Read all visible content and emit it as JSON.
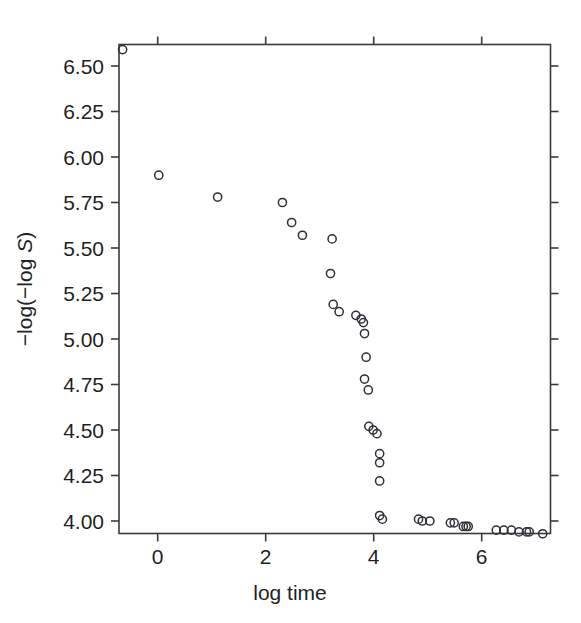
{
  "chart_data": {
    "type": "scatter",
    "title": "",
    "subtitle": "",
    "xlabel": "log time",
    "ylabel": "-log(-log S)",
    "ylabel_parts": {
      "prefix": "−log(−log ",
      "italic": "S",
      "suffix": ")"
    },
    "xlim": [
      -0.72,
      7.28
    ],
    "ylim": [
      3.9,
      6.6
    ],
    "xticks": [
      0,
      2,
      4,
      6
    ],
    "xtick_labels": [
      "0",
      "2",
      "4",
      "6"
    ],
    "yticks": [
      4.0,
      4.25,
      4.5,
      4.75,
      5.0,
      5.25,
      5.5,
      5.75,
      6.0,
      6.25,
      6.5
    ],
    "ytick_labels": [
      "4.00",
      "4.25",
      "4.50",
      "4.75",
      "5.00",
      "5.25",
      "5.50",
      "5.75",
      "6.00",
      "6.25",
      "6.50"
    ],
    "grid": false,
    "legend": null,
    "marker": "open-circle",
    "marker_color": "#2e2e38",
    "points": [
      {
        "x": -0.65,
        "y": 6.59
      },
      {
        "x": 0.02,
        "y": 5.9
      },
      {
        "x": 1.11,
        "y": 5.78
      },
      {
        "x": 2.31,
        "y": 5.75
      },
      {
        "x": 2.48,
        "y": 5.64
      },
      {
        "x": 2.68,
        "y": 5.57
      },
      {
        "x": 3.23,
        "y": 5.55
      },
      {
        "x": 3.2,
        "y": 5.36
      },
      {
        "x": 3.25,
        "y": 5.19
      },
      {
        "x": 3.36,
        "y": 5.15
      },
      {
        "x": 3.67,
        "y": 5.13
      },
      {
        "x": 3.77,
        "y": 5.11
      },
      {
        "x": 3.81,
        "y": 5.09
      },
      {
        "x": 3.83,
        "y": 5.03
      },
      {
        "x": 3.86,
        "y": 4.9
      },
      {
        "x": 3.83,
        "y": 4.78
      },
      {
        "x": 3.9,
        "y": 4.72
      },
      {
        "x": 3.91,
        "y": 4.52
      },
      {
        "x": 3.99,
        "y": 4.5
      },
      {
        "x": 4.06,
        "y": 4.48
      },
      {
        "x": 4.11,
        "y": 4.37
      },
      {
        "x": 4.11,
        "y": 4.32
      },
      {
        "x": 4.11,
        "y": 4.22
      },
      {
        "x": 4.11,
        "y": 4.03
      },
      {
        "x": 4.16,
        "y": 4.01
      },
      {
        "x": 4.83,
        "y": 4.01
      },
      {
        "x": 4.9,
        "y": 4.0
      },
      {
        "x": 5.04,
        "y": 4.0
      },
      {
        "x": 5.42,
        "y": 3.99
      },
      {
        "x": 5.49,
        "y": 3.99
      },
      {
        "x": 5.66,
        "y": 3.97
      },
      {
        "x": 5.71,
        "y": 3.97
      },
      {
        "x": 5.75,
        "y": 3.97
      },
      {
        "x": 6.27,
        "y": 3.95
      },
      {
        "x": 6.41,
        "y": 3.95
      },
      {
        "x": 6.55,
        "y": 3.95
      },
      {
        "x": 6.69,
        "y": 3.94
      },
      {
        "x": 6.83,
        "y": 3.94
      },
      {
        "x": 6.88,
        "y": 3.94
      },
      {
        "x": 7.13,
        "y": 3.93
      }
    ]
  },
  "axes": {
    "x_title": "log time",
    "y_title_prefix": "−log(−log ",
    "y_title_italic": "S",
    "y_title_suffix": ")"
  }
}
